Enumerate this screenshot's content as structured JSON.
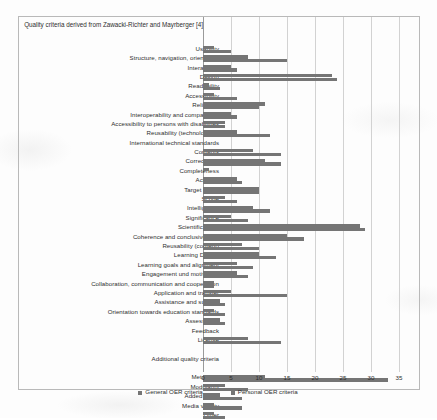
{
  "chart_data": {
    "type": "bar",
    "orientation": "horizontal",
    "title": "Quality criteria derived from Zawacki-Richter and Mayrberger [4]",
    "subtitle": "",
    "xlabel": "",
    "ylabel": "",
    "xlim": [
      0,
      35
    ],
    "xticks": [
      0,
      5,
      10,
      15,
      20,
      25,
      30,
      35
    ],
    "grid": true,
    "legend_position": "bottom",
    "section_headers": [
      "Quality criteria derived from Zawacki-Richter and Mayrberger [4]",
      "Additional quality criteria"
    ],
    "categories": [
      "Usability",
      "Structure, navigation, orientation",
      "Interactivity",
      "Design",
      "Readability",
      "Accessibility",
      "Reliability",
      "Interoperability and compatibility",
      "Accessibility to persons with disabilities",
      "Reusability (technological)",
      "International technical standards",
      "Contents",
      "Correctness",
      "Completeness",
      "Actuality",
      "Target group",
      "Scope",
      "Intelligibility",
      "Significance",
      "Scientific basis",
      "Coherence and conclusiveness",
      "Reusability (content)",
      "Learning Design",
      "Learning goals and alignment",
      "Engagement und motivation",
      "Collaboration, communication and cooperation",
      "Application and transfer",
      "Assistance and support",
      "Orientation towards education standards",
      "Assessment",
      "Feedback",
      "License",
      "Meta data",
      "Modularity",
      "Added value",
      "Media variety",
      "Other"
    ],
    "series": [
      {
        "name": "General OER criteria",
        "color": "#757575",
        "values": [
          2,
          8,
          5,
          23,
          1,
          2,
          11,
          5,
          4,
          6,
          0,
          9,
          11,
          1,
          6,
          10,
          4,
          9,
          5,
          28,
          15,
          7,
          10,
          6,
          6,
          2,
          5,
          3,
          2,
          3,
          0,
          8,
          11,
          4,
          3,
          2,
          2
        ]
      },
      {
        "name": "Personal OER criteria",
        "color": "#757575",
        "values": [
          5,
          15,
          6,
          24,
          3,
          6,
          10,
          6,
          4,
          12,
          0,
          14,
          14,
          0,
          7,
          10,
          6,
          12,
          8,
          29,
          18,
          10,
          13,
          9,
          8,
          2,
          15,
          4,
          4,
          4,
          0,
          14,
          33,
          8,
          7,
          7,
          4
        ]
      }
    ]
  },
  "legend": {
    "items": [
      {
        "label": "General OER criteria",
        "color": "#757575"
      },
      {
        "label": "Personal OER criteria",
        "color": "#757575"
      }
    ]
  },
  "caption": ""
}
